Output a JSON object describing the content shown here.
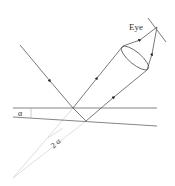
{
  "diagram": {
    "labels": {
      "eye": "Eye",
      "alpha": "α",
      "two_alpha": "2 α"
    },
    "colors": {
      "line": "#555555",
      "faint": "#bbbbbb",
      "text": "#333333"
    }
  }
}
